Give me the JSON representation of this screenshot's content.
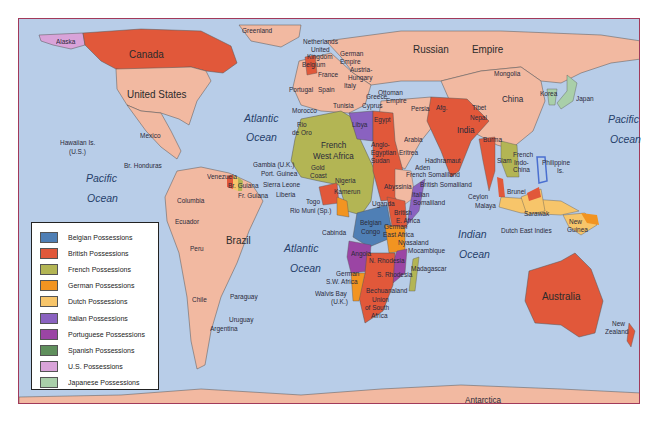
{
  "map": {
    "title": "Imperialism in 1914 - World Colonial Possessions",
    "frame_color": "#a23a5a",
    "ocean_color": "#b8cde8",
    "independent_color": "#f2b9a1"
  },
  "oceans": {
    "atlantic_n_1": "Atlantic",
    "atlantic_n_2": "Ocean",
    "atlantic_s_1": "Atlantic",
    "atlantic_s_2": "Ocean",
    "pacific_e_1": "Pacific",
    "pacific_e_2": "Ocean",
    "pacific_w_1": "Pacific",
    "pacific_w_2": "Ocean",
    "indian_1": "Indian",
    "indian_2": "Ocean"
  },
  "labels": {
    "alaska": "Alaska",
    "canada": "Canada",
    "greenland": "Greenland",
    "united_states": "United States",
    "mexico": "Mexico",
    "hawaii_1": "Hawaiian Is.",
    "hawaii_2": "(U.S.)",
    "br_honduras": "Br. Honduras",
    "venezuela": "Venezuela",
    "br_guiana": "Br. Guiana",
    "fr_guiana": "Fr. Guiana",
    "columbia": "Columbia",
    "ecuador": "Ecuador",
    "peru": "Peru",
    "brazil": "Brazil",
    "chile": "Chile",
    "paraguay": "Paraguay",
    "uruguay": "Uruguay",
    "argentina": "Argentina",
    "netherlands": "Netherlands",
    "uk_1": "United",
    "uk_2": "Kingdom",
    "belgium": "Belgium",
    "france": "France",
    "portugal": "Portugal",
    "spain": "Spain",
    "german_empire_1": "German",
    "german_empire_2": "Empire",
    "austria_1": "Austria-",
    "austria_2": "Hungary",
    "italy": "Italy",
    "greece": "Greece",
    "ottoman_1": "Ottoman",
    "ottoman_2": "Empire",
    "russian": "Russian",
    "empire": "Empire",
    "mongolia": "Mongolia",
    "china": "China",
    "korea": "Korea",
    "japan": "Japan",
    "morocco": "Morocco",
    "rio_de_oro_1": "Rio",
    "rio_de_oro_2": "de Oro",
    "tunisia": "Tunisia",
    "cyprus": "Cyprus",
    "libya": "Libya",
    "egypt": "Egypt",
    "persia": "Persia",
    "afg": "Afg.",
    "tibet": "Tibet",
    "nepal": "Nepal",
    "india": "India",
    "burma": "Burma",
    "arabia": "Arabia",
    "french_wa_1": "French",
    "french_wa_2": "West Africa",
    "anglo_1": "Anglo-",
    "anglo_2": "Egyptian",
    "anglo_3": "Sudan",
    "eritrea": "Eritrea",
    "hadhramaut": "Hadhramaut",
    "aden": "Aden",
    "fr_somaliland": "French Somaliland",
    "br_somaliland": "British Somaliland",
    "it_somaliland_1": "Italian",
    "it_somaliland_2": "Somaliland",
    "abyssinia": "Abyssinia",
    "gambia": "Gambia (U.K.)",
    "port_guinea": "Port. Guinea",
    "sierra_leone": "Sierra Leone",
    "liberia": "Liberia",
    "gold_coast_1": "Gold",
    "gold_coast_2": "Coast",
    "nigeria": "Nigeria",
    "kamerun": "Kamerun",
    "togo": "Togo",
    "rio_muni": "Rio Muni (Sp.)",
    "fr_eq_africa": "French Eq. Africa",
    "uganda": "Uganda",
    "br_e_africa_1": "British",
    "br_e_africa_2": "E. Africa",
    "cabinda": "Cabinda",
    "belgian_congo_1": "Belgian",
    "belgian_congo_2": "Congo",
    "ger_e_africa_1": "German",
    "ger_e_africa_2": "East Africa",
    "nyasaland": "Nyasaland",
    "mocambique": "Mocambique",
    "angola": "Angola",
    "n_rhodesia": "N. Rhodesia",
    "s_rhodesia": "S. Rhodesia",
    "madagascar": "Madagascar",
    "ger_sw_africa_1": "German",
    "ger_sw_africa_2": "S.W. Africa",
    "bechuanaland": "Bechuanaland",
    "walvis_1": "Walvis Bay",
    "walvis_2": "(U.K.)",
    "union_sa_1": "Union",
    "union_sa_2": "of South",
    "union_sa_3": "Africa",
    "siam": "Siam",
    "fr_indochina_1": "French",
    "fr_indochina_2": "Indo-",
    "fr_indochina_3": "China",
    "philippine_1": "Philippine",
    "philippine_2": "Is.",
    "ceylon": "Ceylon",
    "malaya": "Malaya",
    "brunei": "Brunei",
    "sarawak": "Sarawak",
    "dutch_ei": "Dutch East Indies",
    "new_guinea_1": "New",
    "new_guinea_2": "Guinea",
    "australia": "Australia",
    "new_zealand_1": "New",
    "new_zealand_2": "Zealand",
    "antarctica": "Antarctica"
  },
  "legend": {
    "items": [
      {
        "label": "Belgian Possessions",
        "color": "#4f7fb5"
      },
      {
        "label": "British Possessions",
        "color": "#e1583a"
      },
      {
        "label": "French Possessions",
        "color": "#b3b554"
      },
      {
        "label": "German Possessions",
        "color": "#f29421"
      },
      {
        "label": "Dutch Possessions",
        "color": "#f7c56a"
      },
      {
        "label": "Italian Possessions",
        "color": "#8a62c0"
      },
      {
        "label": "Portuguese Possessions",
        "color": "#9b45a4"
      },
      {
        "label": "Spanish Possessions",
        "color": "#5f8f5c"
      },
      {
        "label": "U.S. Possessions",
        "color": "#d9a3d9"
      },
      {
        "label": "Japanese Possessions",
        "color": "#a9cfa9"
      }
    ]
  }
}
